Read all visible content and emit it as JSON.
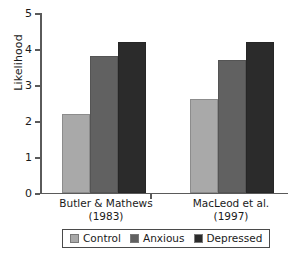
{
  "chart_data": {
    "type": "bar",
    "title": "",
    "xlabel": "",
    "ylabel": "Likelihood",
    "ylim": [
      0,
      5
    ],
    "yticks": [
      "0",
      "1",
      "2",
      "3",
      "4",
      "5"
    ],
    "grid": false,
    "legend_position": "bottom",
    "categories": [
      "Butler & Mathews (1983)",
      "MacLeod et al. (1997)"
    ],
    "category_lines": [
      {
        "line1": "Butler & Mathews",
        "line2": "(1983)"
      },
      {
        "line1": "MacLeod et al.",
        "line2": "(1997)"
      }
    ],
    "series": [
      {
        "name": "Control",
        "color": "#a9a9a9",
        "values": [
          2.2,
          2.6
        ]
      },
      {
        "name": "Anxious",
        "color": "#616161",
        "values": [
          3.8,
          3.7
        ]
      },
      {
        "name": "Depressed",
        "color": "#2b2b2b",
        "values": [
          4.2,
          4.2
        ]
      }
    ]
  },
  "legend": {
    "items": [
      {
        "label": "Control"
      },
      {
        "label": "Anxious"
      },
      {
        "label": "Depressed"
      }
    ]
  },
  "axis": {
    "y_label": "Likelihood"
  }
}
